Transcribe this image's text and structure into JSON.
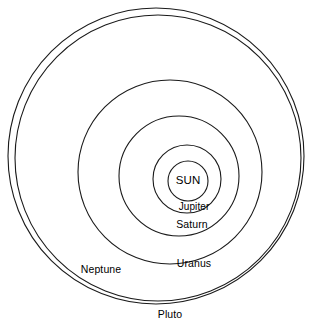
{
  "diagram": {
    "background_color": "#ffffff",
    "stroke_color": "#1a1a1a",
    "text_color": "#000000"
  },
  "chart_data": {
    "type": "scatter",
    "xlabel": "",
    "ylabel": "",
    "grid": false,
    "legend": "none",
    "center": {
      "x": 188,
      "y": 181
    },
    "orbits": [
      {
        "name": "SUN",
        "kind": "star",
        "cx": 188,
        "cy": 181,
        "r": 20,
        "label_x": 188,
        "label_y": 181
      },
      {
        "name": "Jupiter",
        "kind": "orbit",
        "cx": 187,
        "cy": 179,
        "r": 34,
        "label_x": 194,
        "label_y": 207
      },
      {
        "name": "Saturn",
        "kind": "orbit",
        "cx": 179,
        "cy": 176,
        "r": 60,
        "label_x": 192,
        "label_y": 224
      },
      {
        "name": "Uranus",
        "kind": "orbit",
        "cx": 170,
        "cy": 172,
        "r": 92,
        "label_x": 194,
        "label_y": 263
      },
      {
        "name": "Neptune",
        "kind": "orbit",
        "cx": 158,
        "cy": 158,
        "r": 143,
        "label_x": 101,
        "label_y": 269
      },
      {
        "name": "Pluto",
        "kind": "orbit",
        "cx": 156,
        "cy": 156,
        "r": 148,
        "label_x": 170,
        "label_y": 314
      }
    ]
  },
  "labels": {
    "sun": "SUN",
    "jupiter": "Jupiter",
    "saturn": "Saturn",
    "uranus": "Uranus",
    "neptune": "Neptune",
    "pluto": "Pluto"
  }
}
